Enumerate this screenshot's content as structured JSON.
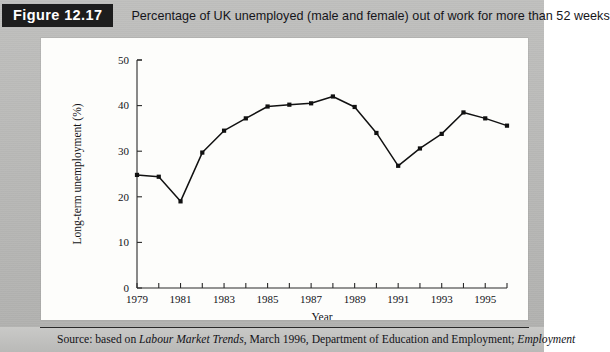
{
  "figure": {
    "number_label": "Figure 12.17",
    "caption": "Percentage of UK unemployed (male and female) out of work for more than 52 weeks"
  },
  "source": {
    "prefix": "Source: based on ",
    "italic_1": "Labour Market Trends",
    "middle": ", March 1996, Department of Education and Employment; ",
    "italic_2": "Employment"
  },
  "colors": {
    "badge_background": "#1d1d1d",
    "badge_text": "#ffffff",
    "page_background": "#b9b9b7",
    "panel_background": "#fdfdfb",
    "line": "#111111",
    "marker": "#111111",
    "axis": "#2a2a2a"
  },
  "chart_data": {
    "type": "line",
    "title": "",
    "xlabel": "Year",
    "ylabel": "Long-term unemployment (%)",
    "xlim": [
      1979,
      1996
    ],
    "ylim": [
      0,
      50
    ],
    "yticks": [
      0,
      10,
      20,
      30,
      40,
      50
    ],
    "ytick_labels": [
      "0",
      "10",
      "20",
      "30",
      "40",
      "50"
    ],
    "xticks": [
      1979,
      1980,
      1981,
      1982,
      1983,
      1984,
      1985,
      1986,
      1987,
      1988,
      1989,
      1990,
      1991,
      1992,
      1993,
      1994,
      1995,
      1996
    ],
    "xtick_labels": [
      "1979",
      "",
      "1981",
      "",
      "1983",
      "",
      "1985",
      "",
      "1987",
      "",
      "1989",
      "",
      "1991",
      "",
      "1993",
      "",
      "1995",
      ""
    ],
    "grid": false,
    "legend": false,
    "markers": "filled-square",
    "series": [
      {
        "name": "Long-term unemployment",
        "x": [
          1979,
          1980,
          1981,
          1982,
          1983,
          1984,
          1985,
          1986,
          1987,
          1988,
          1989,
          1990,
          1991,
          1992,
          1993,
          1994,
          1995,
          1996
        ],
        "values": [
          24.8,
          24.4,
          19.0,
          29.7,
          34.5,
          37.2,
          39.8,
          40.2,
          40.5,
          42.0,
          39.7,
          34.0,
          26.8,
          30.6,
          33.8,
          38.5,
          37.2,
          35.6
        ]
      }
    ]
  }
}
